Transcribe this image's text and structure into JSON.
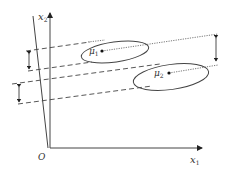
{
  "diagram": {
    "axes": {
      "x1_label": "x",
      "x1_sub": "1",
      "x2_label": "x",
      "x2_sub": "2",
      "origin_label": "O"
    },
    "clusters": [
      {
        "mean_label": "μ",
        "mean_sub": "1"
      },
      {
        "mean_label": "μ",
        "mean_sub": "2"
      }
    ],
    "colors": {
      "stroke": "#333333",
      "background": "#ffffff"
    }
  }
}
